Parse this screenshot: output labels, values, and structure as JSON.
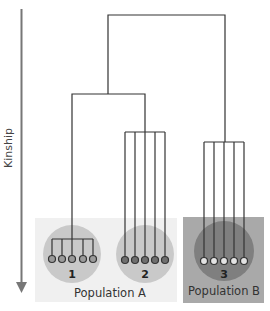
{
  "diagram": {
    "type": "dendrogram",
    "axis": {
      "label": "Kinship",
      "direction": "down",
      "color": "#777777"
    },
    "groups": [
      {
        "id": 1,
        "label": "1",
        "population": "A",
        "members": 5,
        "circle_color": "#c9c9c9",
        "dot_fill": "#9a9a9a",
        "structure": "single-lineage bracket (close kin)"
      },
      {
        "id": 2,
        "label": "2",
        "population": "A",
        "members": 5,
        "circle_color": "#c9c9c9",
        "dot_fill": "#6e6e6e",
        "structure": "separate lineages"
      },
      {
        "id": 3,
        "label": "3",
        "population": "B",
        "members": 5,
        "circle_color": "#7f7f7f",
        "dot_fill": "#e2e2e2",
        "structure": "separate lineages"
      }
    ],
    "populations": [
      {
        "id": "A",
        "label": "Population A",
        "background": "#f0f0f0",
        "groups": [
          1,
          2
        ]
      },
      {
        "id": "B",
        "label": "Population B",
        "background": "#a9a9a9",
        "groups": [
          3
        ]
      }
    ],
    "line_color": "#333333"
  }
}
